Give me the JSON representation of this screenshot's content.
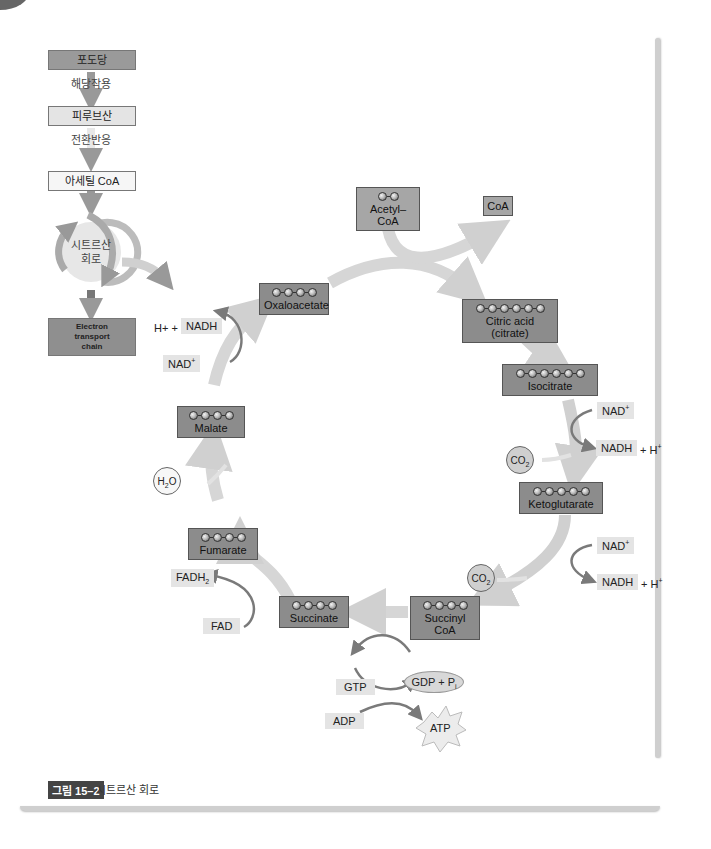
{
  "overview": {
    "steps": [
      {
        "label": "포도당"
      },
      {
        "label": "피루브산"
      },
      {
        "label": "아세틸 CoA"
      },
      {
        "label": "시트르산\n회로"
      },
      {
        "label": "Electron transport chain"
      }
    ],
    "transitions": [
      "해당작용",
      "전환반응"
    ],
    "cycle_label_line1": "시트르산",
    "cycle_label_line2": "회로",
    "etc_line1": "Electron",
    "etc_line2": "transport",
    "etc_line3": "chain"
  },
  "cycle": {
    "input": {
      "name": "Acetyl–CoA",
      "carbons": 2
    },
    "release": {
      "name": "CoA"
    },
    "molecules": [
      {
        "id": "oxaloacetate",
        "name": "Oxaloacetate",
        "carbons": 4
      },
      {
        "id": "citrate",
        "name": "Citric acid (citrate)",
        "carbons": 6
      },
      {
        "id": "isocitrate",
        "name": "Isocitrate",
        "carbons": 6
      },
      {
        "id": "ketoglutarate",
        "name": "Ketoglutarate",
        "carbons": 5
      },
      {
        "id": "succinyl-coa",
        "name": "Succinyl CoA",
        "carbons": 4
      },
      {
        "id": "succinate",
        "name": "Succinate",
        "carbons": 4
      },
      {
        "id": "fumarate",
        "name": "Fumarate",
        "carbons": 4
      },
      {
        "id": "malate",
        "name": "Malate",
        "carbons": 4
      }
    ],
    "cofactors": {
      "step3_in": "NAD+",
      "step3_out": "NADH",
      "step3_h": "+ H+",
      "step3_co2": "CO2",
      "step4_in": "NAD+",
      "step4_out": "NADH",
      "step4_h": "+ H+",
      "step4_co2": "CO2",
      "step5_gtp": "GTP",
      "step5_gdp": "GDP + Pi",
      "step5_adp": "ADP",
      "step5_atp": "ATP",
      "step6_in": "FAD",
      "step6_out": "FADH2",
      "step7_h2o": "H2O",
      "step8_in": "NAD+",
      "step8_out": "NADH",
      "step8_h": "H+ +"
    }
  },
  "caption": {
    "tag": "그림 15–2",
    "text": "시트르산 회로"
  },
  "colors": {
    "molecule_box": "#8c8c8c",
    "cofactor_box": "#e4e4e4",
    "flow_arrow": "#d6d6d6",
    "cofactor_arrow": "#7a7a7a",
    "caption_tag": "#444444"
  }
}
